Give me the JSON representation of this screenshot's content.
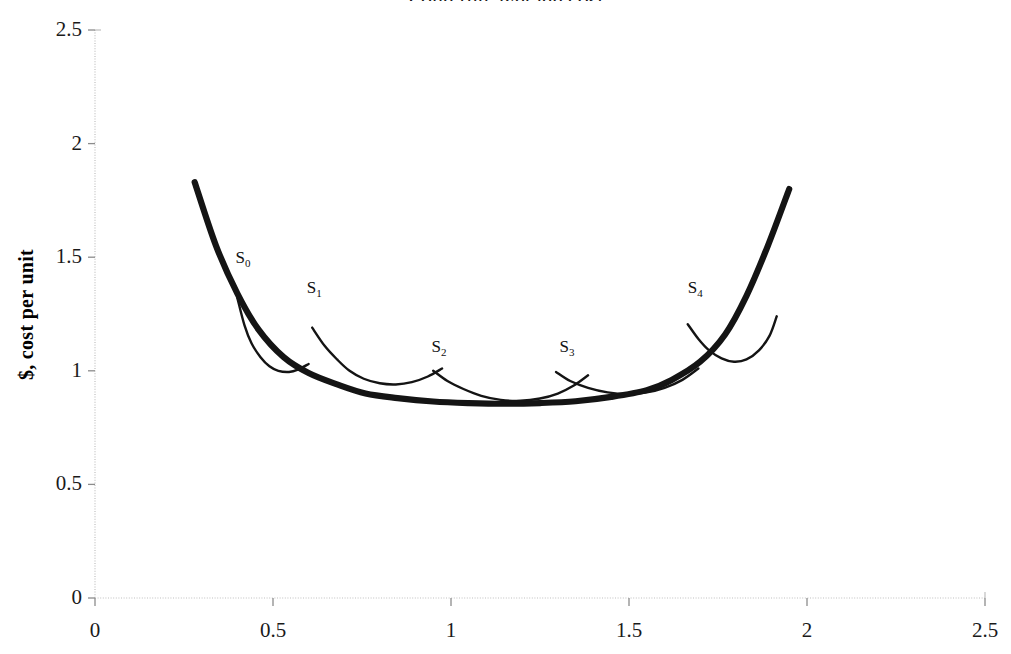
{
  "chart_data": {
    "type": "line",
    "title": "Long run average cost",
    "xlabel": "",
    "ylabel": "$, cost per unit",
    "xlim": [
      0,
      2.5
    ],
    "ylim": [
      0,
      2.5
    ],
    "xticks": [
      "0",
      "0.5",
      "1",
      "1.5",
      "2",
      "2.5"
    ],
    "xtick_values": [
      0,
      0.5,
      1,
      1.5,
      2,
      2.5
    ],
    "yticks": [
      "0",
      "0.5",
      "1",
      "1.5",
      "2",
      "2.5"
    ],
    "ytick_values": [
      0,
      0.5,
      1,
      1.5,
      2,
      2.5
    ],
    "grid": false,
    "legend": "none",
    "series": [
      {
        "name": "LRAC envelope",
        "style": "thick-black",
        "annotation": "Long run average cost envelope curve, U-shaped, tangent to each short run curve",
        "points": [
          [
            0.28,
            1.83
          ],
          [
            0.34,
            1.55
          ],
          [
            0.4,
            1.34
          ],
          [
            0.46,
            1.18
          ],
          [
            0.53,
            1.06
          ],
          [
            0.6,
            0.99
          ],
          [
            0.68,
            0.94
          ],
          [
            0.76,
            0.9
          ],
          [
            0.85,
            0.88
          ],
          [
            0.95,
            0.865
          ],
          [
            1.05,
            0.858
          ],
          [
            1.15,
            0.855
          ],
          [
            1.25,
            0.858
          ],
          [
            1.35,
            0.866
          ],
          [
            1.45,
            0.885
          ],
          [
            1.55,
            0.915
          ],
          [
            1.62,
            0.96
          ],
          [
            1.7,
            1.04
          ],
          [
            1.77,
            1.16
          ],
          [
            1.83,
            1.33
          ],
          [
            1.89,
            1.55
          ],
          [
            1.95,
            1.8
          ]
        ]
      },
      {
        "name": "S0",
        "label": "S",
        "subscript": "0",
        "style": "thin-black",
        "annotation": "Short run average cost curve 0, tangent to LRAC at its low point",
        "points": [
          [
            0.4,
            1.32
          ],
          [
            0.42,
            1.2
          ],
          [
            0.44,
            1.12
          ],
          [
            0.465,
            1.06
          ],
          [
            0.49,
            1.02
          ],
          [
            0.515,
            1.0
          ],
          [
            0.545,
            0.995
          ],
          [
            0.57,
            1.005
          ],
          [
            0.6,
            1.03
          ]
        ],
        "tangent_point": [
          0.52,
          0.998
        ]
      },
      {
        "name": "S1",
        "label": "S",
        "subscript": "1",
        "style": "thin-black",
        "annotation": "Short run average cost curve 1, tangent to LRAC",
        "points": [
          [
            0.61,
            1.19
          ],
          [
            0.645,
            1.11
          ],
          [
            0.68,
            1.05
          ],
          [
            0.715,
            1.0
          ],
          [
            0.755,
            0.965
          ],
          [
            0.8,
            0.945
          ],
          [
            0.845,
            0.94
          ],
          [
            0.89,
            0.95
          ],
          [
            0.935,
            0.975
          ],
          [
            0.975,
            1.01
          ]
        ],
        "tangent_point": [
          0.845,
          0.94
        ]
      },
      {
        "name": "S2",
        "label": "S",
        "subscript": "2",
        "style": "thin-black",
        "annotation": "Short run average cost curve 2, tangent to LRAC near the minimum",
        "points": [
          [
            0.95,
            1.0
          ],
          [
            0.99,
            0.955
          ],
          [
            1.035,
            0.92
          ],
          [
            1.085,
            0.89
          ],
          [
            1.14,
            0.872
          ],
          [
            1.195,
            0.868
          ],
          [
            1.25,
            0.878
          ],
          [
            1.3,
            0.9
          ],
          [
            1.345,
            0.935
          ],
          [
            1.385,
            0.98
          ]
        ],
        "tangent_point": [
          1.17,
          0.867
        ]
      },
      {
        "name": "S3",
        "label": "S",
        "subscript": "3",
        "style": "thin-black",
        "annotation": "Short run average cost curve 3, tangent to LRAC",
        "points": [
          [
            1.295,
            0.995
          ],
          [
            1.335,
            0.955
          ],
          [
            1.385,
            0.925
          ],
          [
            1.44,
            0.905
          ],
          [
            1.495,
            0.898
          ],
          [
            1.55,
            0.905
          ],
          [
            1.6,
            0.925
          ],
          [
            1.65,
            0.96
          ],
          [
            1.695,
            1.01
          ]
        ],
        "tangent_point": [
          1.5,
          0.898
        ]
      },
      {
        "name": "S4",
        "label": "S",
        "subscript": "4",
        "style": "thin-black",
        "annotation": "Short run average cost curve 4, tangent to LRAC on the rising arm",
        "points": [
          [
            1.665,
            1.205
          ],
          [
            1.695,
            1.14
          ],
          [
            1.725,
            1.09
          ],
          [
            1.76,
            1.055
          ],
          [
            1.795,
            1.04
          ],
          [
            1.83,
            1.05
          ],
          [
            1.865,
            1.09
          ],
          [
            1.895,
            1.155
          ],
          [
            1.915,
            1.24
          ]
        ],
        "tangent_point": [
          1.8,
          1.04
        ]
      }
    ],
    "curve_labels": [
      {
        "text": "S",
        "sub": "0",
        "x": 0.395,
        "y": 1.495
      },
      {
        "text": "S",
        "sub": "1",
        "x": 0.595,
        "y": 1.365
      },
      {
        "text": "S",
        "sub": "2",
        "x": 0.945,
        "y": 1.105
      },
      {
        "text": "S",
        "sub": "3",
        "x": 1.305,
        "y": 1.105
      },
      {
        "text": "S",
        "sub": "4",
        "x": 1.665,
        "y": 1.365
      }
    ]
  },
  "axes": {
    "y_title": "$, cost per unit",
    "x_tick_labels": [
      "0",
      "0.5",
      "1",
      "1.5",
      "2",
      "2.5"
    ],
    "y_tick_labels": [
      "0",
      "0.5",
      "1",
      "1.5",
      "2",
      "2.5"
    ]
  },
  "colors": {
    "curve": "#141414",
    "axis": "#bfbfbf",
    "text": "#1a1a1a",
    "background": "#ffffff"
  }
}
